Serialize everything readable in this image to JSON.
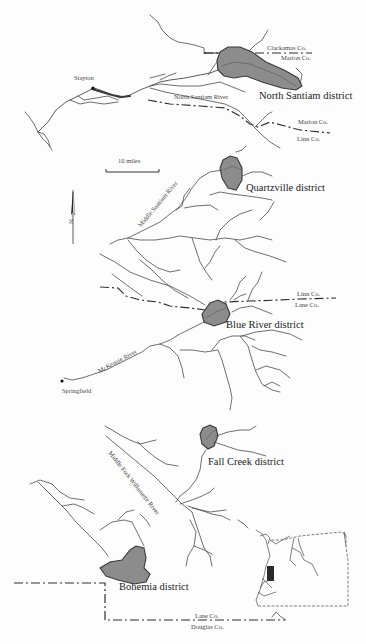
{
  "map": {
    "districts": [
      {
        "id": "north-santiam",
        "label": "North Santiam district"
      },
      {
        "id": "quartzville",
        "label": "Quartzville district"
      },
      {
        "id": "blue-river",
        "label": "Blue River district"
      },
      {
        "id": "fall-creek",
        "label": "Fall Creek district"
      },
      {
        "id": "bohemia",
        "label": "Bohemia district"
      }
    ],
    "towns": [
      {
        "id": "stayton",
        "label": "Stayton"
      },
      {
        "id": "springfield",
        "label": "Springfield"
      }
    ],
    "rivers": [
      {
        "id": "north-santiam-river",
        "label": "North Santiam River"
      },
      {
        "id": "middle-santiam-river",
        "label": "Middle Santiam River"
      },
      {
        "id": "mckenzie-river",
        "label": "McKenzie River"
      },
      {
        "id": "middle-fork-willamette-river",
        "label": "Middle Fork Willamette River"
      }
    ],
    "county_labels": {
      "clackamas": "Clackamas Co.",
      "marion_top": "Marion Co.",
      "marion": "Marion Co.",
      "linn": "Linn Co.",
      "linn_2": "Linn Co.",
      "lane": "Lane Co.",
      "lane_2": "Lane Co.",
      "douglas": "Douglas Co."
    },
    "scale_bar": {
      "label": "10 miles"
    },
    "north_arrow": {
      "label": "N",
      "icon": "north-arrow-icon"
    },
    "inset": {
      "description": "Oregon state outline with location rectangle",
      "icon": "oregon-inset-map"
    },
    "colors": {
      "district_fill": "#8c8c8c",
      "district_stroke": "#3a3a3a",
      "line": "#4a4a4a",
      "location_box": "#2a2a2a"
    }
  }
}
